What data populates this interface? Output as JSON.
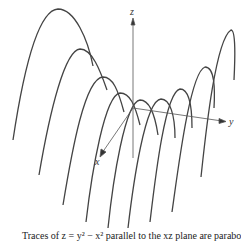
{
  "figure": {
    "axes": {
      "x_label": "x",
      "y_label": "y",
      "z_label": "z"
    },
    "caption": "Traces of z = y² − x² parallel to the xz plane are parabolas",
    "colors": {
      "curve": "#444444",
      "axis": "#555555",
      "background": "#ffffff"
    }
  }
}
